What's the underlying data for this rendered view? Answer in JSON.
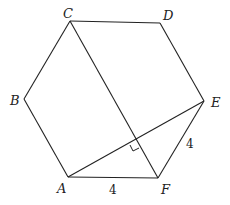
{
  "diagram": {
    "type": "geometry",
    "shape": "regular hexagon",
    "vertices": {
      "A": {
        "label": "A",
        "x": 68,
        "y": 177
      },
      "B": {
        "label": "B",
        "x": 24,
        "y": 99
      },
      "C": {
        "label": "C",
        "x": 70,
        "y": 21
      },
      "D": {
        "label": "D",
        "x": 160,
        "y": 23
      },
      "E": {
        "label": "E",
        "x": 204,
        "y": 101
      },
      "F": {
        "label": "F",
        "x": 158,
        "y": 178
      }
    },
    "segments": [
      "AB",
      "BC",
      "CD",
      "DE",
      "EF",
      "FA",
      "CF",
      "AE"
    ],
    "side_labels": {
      "AF": "4",
      "EF": "4"
    },
    "right_angle_marker": "intersection of CF and AE"
  },
  "colors": {
    "stroke": "#222222",
    "background": "#ffffff"
  }
}
